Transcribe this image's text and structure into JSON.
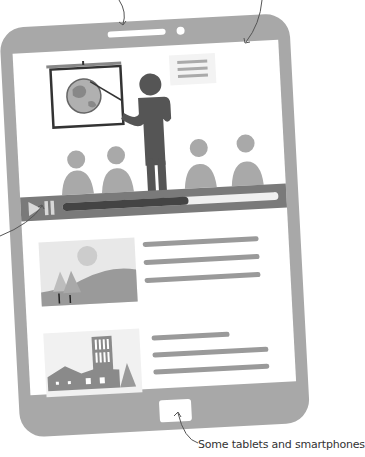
{
  "caption": {
    "text": "Some tablets and smartphones"
  },
  "colors": {
    "frame": "#a8a8a8",
    "screen": "#ffffff",
    "presenter": "#555555",
    "audience": "#a9a9a9",
    "control_bar": "#7a7a7a",
    "progress_played": "#444444",
    "progress_track": "#f0f0f0",
    "text_line": "#9a9a9a",
    "thumb_bg": "#ececec"
  },
  "video": {
    "play_icon": "play-icon",
    "pause_icon": "pause-icon",
    "progress_percent": 58
  },
  "list_items": [
    {
      "thumbnail": "landscape-thumbnail",
      "lines": 3
    },
    {
      "thumbnail": "city-thumbnail",
      "lines": 3
    }
  ]
}
